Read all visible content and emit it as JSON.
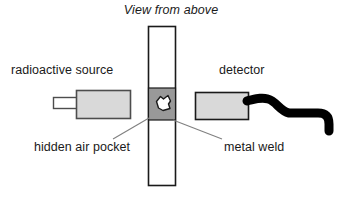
{
  "figure": {
    "title": "View from above",
    "width": 342,
    "height": 201,
    "background": "#ffffff"
  },
  "labels": {
    "source": "radioactive source",
    "detector": "detector",
    "air_pocket": "hidden air pocket",
    "metal_weld": "metal weld"
  },
  "colors": {
    "outline": "#1a1a1a",
    "box_fill": "#d9d9d9",
    "weld_fill": "#999999",
    "pipe_fill": "#ffffff",
    "pocket_fill": "#ffffff",
    "cable": "#000000",
    "leader": "#808080",
    "text": "#1a1a1a"
  },
  "diagram": {
    "pipe": {
      "x": 148,
      "y": 26,
      "width": 28,
      "height": 160,
      "fill": "#ffffff"
    },
    "weld": {
      "x": 148,
      "y": 88,
      "width": 28,
      "height": 32,
      "fill": "#999999"
    },
    "air_pocket": {
      "cx": 162,
      "cy": 103,
      "fill": "#ffffff"
    },
    "source_box": {
      "x": 76,
      "y": 90,
      "width": 54,
      "height": 28,
      "fill": "#d9d9d9"
    },
    "source_nozzle": {
      "x": 53,
      "y": 97,
      "width": 24,
      "height": 11,
      "fill": "#ffffff"
    },
    "detector_box": {
      "x": 195,
      "y": 92,
      "width": 53,
      "height": 27,
      "fill": "#d9d9d9"
    },
    "detector_cable": {
      "fill": "#000000",
      "thickness": 9
    },
    "leader_pocket": {
      "x1": 149,
      "y1": 118,
      "x2": 113,
      "y2": 139
    },
    "leader_weld": {
      "x1": 173,
      "y1": 120,
      "x2": 222,
      "y2": 139
    }
  }
}
